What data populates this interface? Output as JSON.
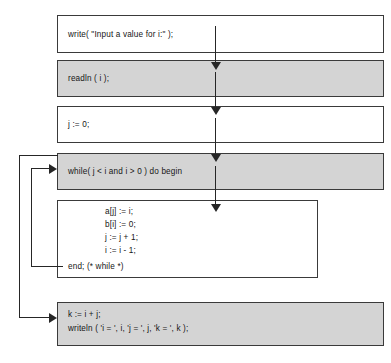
{
  "diagram": {
    "type": "program-flowchart",
    "title": "",
    "colors": {
      "shaded_box_fill": "#d4d4d4",
      "plain_box_fill": "#ffffff",
      "border": "#3a3a3a",
      "arrow": "#262626",
      "text": "#161616"
    },
    "boxes": [
      {
        "id": "write-prompt",
        "shaded": false,
        "lines": [
          "write( \"Input a value for i:\" );"
        ]
      },
      {
        "id": "readln",
        "shaded": true,
        "lines": [
          "readln ( i );"
        ]
      },
      {
        "id": "init-j",
        "shaded": false,
        "lines": [
          "j := 0;"
        ]
      },
      {
        "id": "while-head",
        "shaded": true,
        "lines": [
          "while( j < i and i > 0 ) do begin"
        ]
      },
      {
        "id": "loop-body",
        "shaded": false,
        "lines": [
          "a[j] := i;",
          "b[i] := 0;",
          "j := j + 1;",
          "i := i - 1;",
          "end; (* while *)"
        ]
      },
      {
        "id": "final",
        "shaded": true,
        "lines": [
          "k := i + j;",
          "writeln ( 'i = ', i, 'j = ', j, 'k = ', k );"
        ]
      }
    ],
    "flow_arrows": [
      {
        "id": "arrow-write-to-readln",
        "from": "write-prompt",
        "to": "readln"
      },
      {
        "id": "arrow-readln-to-initj",
        "from": "readln",
        "to": "init-j"
      },
      {
        "id": "arrow-initj-to-while",
        "from": "init-j",
        "to": "while-head"
      },
      {
        "id": "arrow-while-to-body",
        "from": "while-head",
        "to": "loop-body"
      }
    ],
    "loop_arrows": [
      {
        "id": "loop-back-inner",
        "from": "loop-body",
        "to": "while-head",
        "label": ""
      },
      {
        "id": "loop-exit-outer",
        "from": "while-head",
        "to": "final",
        "label": ""
      }
    ]
  }
}
